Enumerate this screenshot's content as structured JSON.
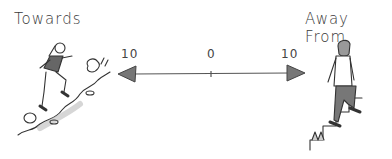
{
  "diagram": {
    "left_label": "Towards",
    "right_label": "Away From",
    "scale": {
      "left_value": "10",
      "center_value": "0",
      "right_value": "10"
    },
    "colors": {
      "ink": "#3a3a3a",
      "arrowhead": "#777777",
      "shirt": "#666666",
      "ground": "#bbbbbb"
    },
    "figures": [
      {
        "side": "left",
        "description": "woman running uphill on rocky slope"
      },
      {
        "side": "right",
        "description": "man walking up stairs"
      }
    ]
  }
}
